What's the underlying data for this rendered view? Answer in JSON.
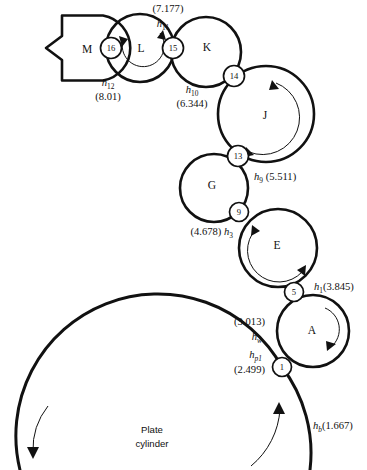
{
  "diagram": {
    "plate_caption_line1": "Plate",
    "plate_caption_line2": "cylinder",
    "rollers": [
      {
        "id": "M",
        "label": "M",
        "shape": "notched-disc",
        "cx": 92,
        "cy": 48,
        "r": 33
      },
      {
        "id": "L",
        "label": "L",
        "shape": "circle",
        "cx": 140,
        "cy": 48,
        "r": 34
      },
      {
        "id": "K",
        "label": "K",
        "shape": "circle",
        "cx": 206,
        "cy": 52,
        "r": 35
      },
      {
        "id": "J",
        "label": "J",
        "shape": "circle",
        "cx": 266,
        "cy": 114,
        "r": 48
      },
      {
        "id": "G",
        "label": "G",
        "shape": "circle",
        "cx": 214,
        "cy": 188,
        "r": 34
      },
      {
        "id": "E",
        "label": "E",
        "shape": "circle",
        "cx": 278,
        "cy": 248,
        "r": 39
      },
      {
        "id": "A",
        "label": "A",
        "shape": "circle",
        "cx": 313,
        "cy": 331,
        "r": 36
      }
    ],
    "nodes": [
      {
        "number": "16",
        "cx": 111,
        "cy": 48,
        "r": 10.5
      },
      {
        "number": "15",
        "cx": 173,
        "cy": 48,
        "r": 10.5
      },
      {
        "number": "14",
        "cx": 234,
        "cy": 76,
        "r": 10.5
      },
      {
        "number": "13",
        "cx": 238,
        "cy": 156,
        "r": 10.5
      },
      {
        "number": "9",
        "cx": 239,
        "cy": 212,
        "r": 9.5
      },
      {
        "number": "5",
        "cx": 294,
        "cy": 292,
        "r": 9.5
      },
      {
        "number": "1",
        "cx": 282,
        "cy": 367,
        "r": 9.5
      }
    ],
    "gap_labels": [
      {
        "name": "h11",
        "symbol": "h",
        "subscript": "11",
        "value": "(7.177)",
        "value_position": "above",
        "x": 168,
        "y": 10,
        "align": "middle"
      },
      {
        "name": "h12",
        "symbol": "h",
        "subscript": "12",
        "value": "(8.01)",
        "value_position": "below",
        "x": 108,
        "y": 85,
        "align": "middle"
      },
      {
        "name": "h10",
        "symbol": "h",
        "subscript": "10",
        "value": "(6.344)",
        "value_position": "below",
        "x": 192,
        "y": 92,
        "align": "middle"
      },
      {
        "name": "h9",
        "symbol": "h",
        "subscript": "9",
        "value": "(5.511)",
        "value_position": "inline-after",
        "x": 255,
        "y": 176,
        "align": "start"
      },
      {
        "name": "h3",
        "symbol": "h",
        "subscript": "3",
        "value": "(4.678)",
        "value_position": "inline-before",
        "x": 232,
        "y": 231,
        "align": "end"
      },
      {
        "name": "h1",
        "symbol": "h",
        "subscript": "1",
        "value": "(3.845)",
        "value_position": "inline-after",
        "x": 315,
        "y": 286,
        "align": "start"
      },
      {
        "name": "hw",
        "symbol": "h",
        "subscript": "w",
        "value": "(3.013)",
        "value_position": "above",
        "x": 262,
        "y": 323,
        "align": "end"
      },
      {
        "name": "hp1",
        "symbol": "h",
        "subscript": "p1",
        "value": "(2.499)",
        "value_position": "below",
        "x": 262,
        "y": 355,
        "align": "end"
      },
      {
        "name": "hb",
        "symbol": "h",
        "subscript": "b",
        "value": "(1.667)",
        "value_position": "inline-after",
        "x": 312,
        "y": 425,
        "align": "start"
      }
    ],
    "rotation_arrows": [
      {
        "roller": "L",
        "direction": "counter-clockwise"
      },
      {
        "roller": "J",
        "direction": "clockwise"
      },
      {
        "roller": "E",
        "direction": "counter-clockwise"
      },
      {
        "roller": "A",
        "direction": "clockwise"
      },
      {
        "roller": "plate-cylinder-left",
        "direction": "down"
      },
      {
        "roller": "plate-cylinder-right",
        "direction": "up"
      }
    ],
    "colors": {
      "stroke": "#111111",
      "background": "#ffffff",
      "node_fill": "#ffffff"
    }
  }
}
